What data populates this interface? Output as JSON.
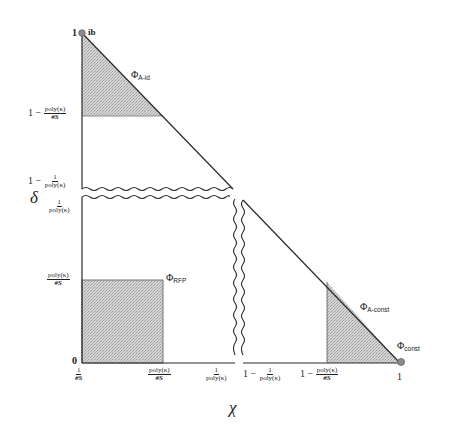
{
  "diagram": {
    "axes": {
      "x_label": "χ",
      "y_label": "δ"
    },
    "y_ticks": [
      {
        "id": "one",
        "text": "1"
      },
      {
        "id": "one_minus_poly_s",
        "prefix": "1 −",
        "num": "poly(κ)",
        "den": "#S"
      },
      {
        "id": "one_minus_inv_poly",
        "prefix": "1 −",
        "num": "1",
        "den": "poly(κ)"
      },
      {
        "id": "inv_poly",
        "num": "1",
        "den": "poly(κ)"
      },
      {
        "id": "poly_s",
        "num": "poly(κ)",
        "den": "#S"
      },
      {
        "id": "zero",
        "text": "0"
      }
    ],
    "x_ticks": [
      {
        "id": "inv_s",
        "num": "1",
        "den": "#S"
      },
      {
        "id": "poly_s",
        "num": "poly(κ)",
        "den": "#S"
      },
      {
        "id": "inv_poly",
        "num": "1",
        "den": "poly(κ)"
      },
      {
        "id": "one_minus_inv_poly",
        "prefix": "1 −",
        "num": "1",
        "den": "poly(κ)"
      },
      {
        "id": "one_minus_poly_s",
        "prefix": "1 −",
        "num": "poly(κ)",
        "den": "#S"
      },
      {
        "id": "one",
        "text": "1"
      }
    ],
    "regions": [
      {
        "id": "A-id",
        "symbol": "Φ",
        "subscript": "A-id"
      },
      {
        "id": "RFP",
        "symbol": "Φ",
        "subscript": "RFP"
      },
      {
        "id": "A-const",
        "symbol": "Φ",
        "subscript": "A-const"
      },
      {
        "id": "const",
        "symbol": "Φ",
        "subscript": "const"
      }
    ],
    "points": [
      {
        "id": "ib",
        "label": "ib"
      }
    ],
    "colors": {
      "line": "#2a2a2a",
      "shade": "#c8c8c8",
      "point": "#888888"
    }
  }
}
